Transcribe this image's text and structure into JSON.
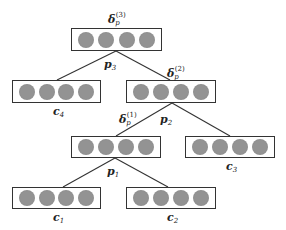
{
  "diagram": {
    "type": "binary-tree",
    "nodes": [
      {
        "id": "root",
        "x": 71,
        "y": 28,
        "w": 91,
        "h": 23,
        "units": 4
      },
      {
        "id": "c4",
        "x": 12,
        "y": 80,
        "w": 89,
        "h": 23,
        "units": 4,
        "label": "c",
        "sub": "4"
      },
      {
        "id": "n2",
        "x": 126,
        "y": 80,
        "w": 90,
        "h": 23,
        "units": 4
      },
      {
        "id": "n1",
        "x": 71,
        "y": 136,
        "w": 90,
        "h": 22,
        "units": 4
      },
      {
        "id": "c3",
        "x": 185,
        "y": 136,
        "w": 90,
        "h": 22,
        "units": 4,
        "label": "c",
        "sub": "3"
      },
      {
        "id": "c1",
        "x": 12,
        "y": 187,
        "w": 89,
        "h": 22,
        "units": 4,
        "label": "c",
        "sub": "1"
      },
      {
        "id": "c2",
        "x": 126,
        "y": 187,
        "w": 90,
        "h": 22,
        "units": 4,
        "label": "c",
        "sub": "2"
      }
    ],
    "labels": {
      "delta3": {
        "base": "δ",
        "sub": "p",
        "sup": "(3)"
      },
      "delta2": {
        "base": "δ",
        "sub": "p",
        "sup": "(2)"
      },
      "delta1": {
        "base": "δ",
        "sub": "p",
        "sup": "(1)"
      },
      "p3": {
        "base": "p",
        "sub": "3"
      },
      "p2": {
        "base": "p",
        "sub": "2"
      },
      "p1": {
        "base": "p",
        "sub": "1"
      },
      "c4": {
        "base": "c",
        "sub": "4"
      },
      "c3": {
        "base": "c",
        "sub": "3"
      },
      "c1": {
        "base": "c",
        "sub": "1"
      },
      "c2": {
        "base": "c",
        "sub": "2"
      }
    },
    "colors": {
      "unit": "#8c8c8c",
      "border": "#333333",
      "edge": "#333333"
    }
  }
}
